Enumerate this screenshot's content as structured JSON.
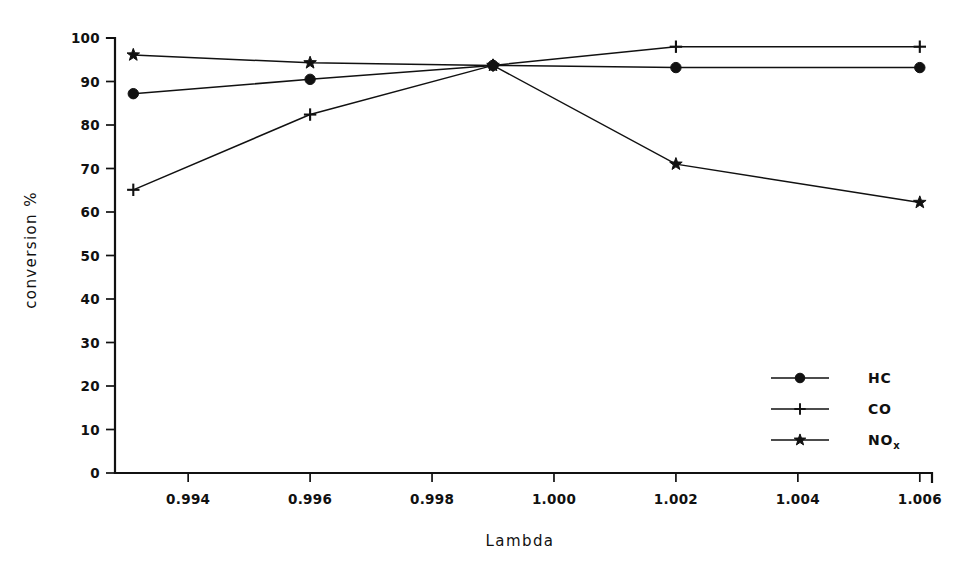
{
  "chart_data": {
    "type": "line",
    "title": "",
    "xlabel": "Lambda",
    "ylabel": "conversion %",
    "xlim": [
      0.9928,
      1.0062
    ],
    "ylim": [
      0,
      100
    ],
    "xticks": [
      "0.994",
      "0.996",
      "0.998",
      "1.000",
      "1.002",
      "1.004",
      "1.006"
    ],
    "xtick_values": [
      0.994,
      0.996,
      0.998,
      1.0,
      1.002,
      1.004,
      1.006
    ],
    "yticks": [
      "0",
      "10",
      "20",
      "30",
      "40",
      "50",
      "60",
      "70",
      "80",
      "90",
      "100"
    ],
    "ytick_values": [
      0,
      10,
      20,
      30,
      40,
      50,
      60,
      70,
      80,
      90,
      100
    ],
    "grid": false,
    "legend_position": "center-right",
    "x": [
      0.9931,
      0.996,
      0.999,
      1.002,
      1.006
    ],
    "series": [
      {
        "name": "HC",
        "marker": "filled-circle",
        "values": [
          87.2,
          90.5,
          93.7,
          93.2,
          93.2
        ]
      },
      {
        "name": "CO",
        "marker": "plus",
        "values": [
          65.1,
          82.4,
          93.7,
          98.0,
          98.0
        ]
      },
      {
        "name": "NOx",
        "marker": "star",
        "values": [
          96.1,
          94.3,
          93.7,
          71.0,
          62.2
        ]
      }
    ],
    "legend": [
      {
        "label": "NO",
        "sublabel": "",
        "marker": "filled-circle",
        "series": "HC",
        "display": "HC"
      },
      {
        "label": "CO",
        "sublabel": "",
        "marker": "plus",
        "series": "CO",
        "display": "CO"
      },
      {
        "label": "NO",
        "sublabel": "x",
        "marker": "star",
        "series": "NOx",
        "display": "NOx"
      }
    ],
    "legend_entries": [
      {
        "text": "HC",
        "sub": "",
        "marker": "filled-circle"
      },
      {
        "text": "CO",
        "sub": "",
        "marker": "plus"
      },
      {
        "text": "NO",
        "sub": "x",
        "marker": "star"
      }
    ],
    "colors": {
      "line": "#111111",
      "marker": "#111111",
      "axis": "#111111",
      "background": "#ffffff"
    }
  }
}
